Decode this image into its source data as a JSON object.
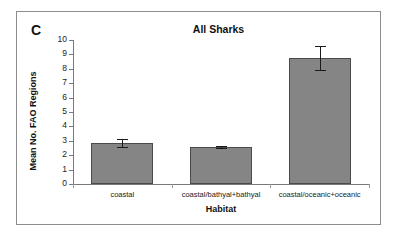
{
  "figure": {
    "panel_label": "C",
    "accent_color": "#858585",
    "bar_edge_color": "#4a4a4a",
    "axis_color": "#7a7a7a",
    "frame_color": "#8c8c8c",
    "background": "#ffffff"
  },
  "chart_data": {
    "type": "bar",
    "title": "All Sharks",
    "xlabel": "Habitat",
    "ylabel": "Mean No. FAO Regions",
    "categories": [
      "coastal",
      "coastal/bathyal+bathyal",
      "coastal/oceanic+oceanic"
    ],
    "values": [
      2.85,
      2.55,
      8.75
    ],
    "errors": [
      0.28,
      0.08,
      0.8
    ],
    "ylim": [
      0,
      10
    ],
    "yticks": [
      0,
      1,
      2,
      3,
      4,
      5,
      6,
      7,
      8,
      9,
      10
    ],
    "ytick_labels": [
      "0",
      "1",
      "2",
      "3",
      "4",
      "5",
      "6",
      "7",
      "8",
      "9",
      "10"
    ],
    "grid": false,
    "legend": false
  }
}
